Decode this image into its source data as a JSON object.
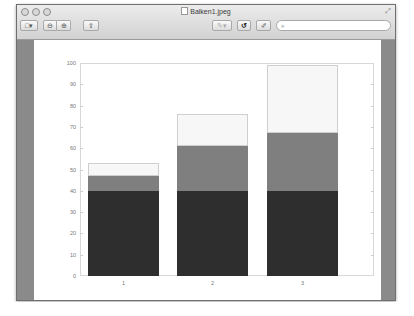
{
  "window": {
    "title": "Balken1.jpeg",
    "traffic_lights": [
      "close",
      "minimize",
      "zoom"
    ]
  },
  "toolbar": {
    "view_button": "□▾",
    "zoom_out": "⊖",
    "zoom_in": "⊕",
    "share": "⇪",
    "annotate": "✎▾",
    "rotate": "↺",
    "edit": "✐",
    "search_placeholder": "⌕"
  },
  "chart_data": {
    "type": "bar",
    "stacked": true,
    "title": "",
    "xlabel": "",
    "ylabel": "",
    "categories": [
      "1",
      "2",
      "3"
    ],
    "series": [
      {
        "name": "bottom",
        "color": "#2e2e2e",
        "values": [
          40,
          40,
          40
        ]
      },
      {
        "name": "middle",
        "color": "#7f7f7f",
        "values": [
          7,
          21,
          27
        ]
      },
      {
        "name": "top",
        "color": "#f7f7f7",
        "values": [
          6,
          15,
          32
        ]
      }
    ],
    "totals": [
      53,
      76,
      99
    ],
    "ylim": [
      0,
      100
    ],
    "yticks": [
      "0",
      "10",
      "20",
      "30",
      "40",
      "50",
      "60",
      "70",
      "80",
      "90",
      "100"
    ],
    "grid": false,
    "legend": "none"
  }
}
